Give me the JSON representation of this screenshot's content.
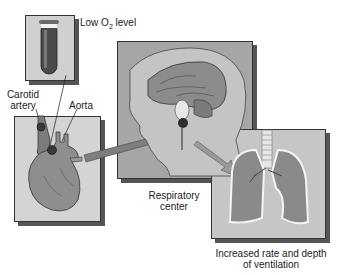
{
  "diagram": {
    "labels": {
      "low_o2_prefix": "Low O",
      "low_o2_sub": "2",
      "low_o2_suffix": " level",
      "carotid_line1": "Carotid",
      "carotid_line2": "artery",
      "aorta": "Aorta",
      "resp_line1": "Respiratory",
      "resp_line2": "center",
      "ventilation_line1": "Increased rate and depth",
      "ventilation_line2": "of ventilation"
    },
    "panels": [
      {
        "name": "test-tube-panel",
        "depicts": "blood sample tube"
      },
      {
        "name": "heart-panel",
        "depicts": "heart with carotid and aortic chemoreceptors"
      },
      {
        "name": "brain-panel",
        "depicts": "head cross-section with brainstem respiratory center"
      },
      {
        "name": "lungs-panel",
        "depicts": "lungs and trachea"
      }
    ],
    "colors": {
      "panel_bg": "#c8c8c8",
      "head_bg": "#a8a8a8",
      "organ": "#8a8a8a",
      "dark": "#3a3a3a"
    }
  }
}
